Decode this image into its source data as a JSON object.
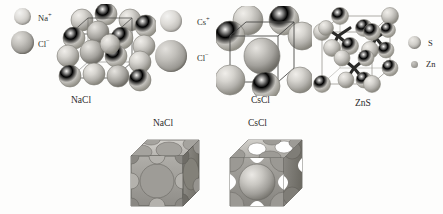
{
  "figure": {
    "background_color": "#fdfdfc",
    "ink_color": "#2b2b2b"
  },
  "legends": {
    "nacl": {
      "items": [
        {
          "label": "Na",
          "charge": "+",
          "icon": "sphere-light-icon",
          "size": "small",
          "name": "sodium-ion"
        },
        {
          "label": "Cl",
          "charge": "−",
          "icon": "sphere-dark-icon",
          "size": "large",
          "name": "chloride-ion"
        }
      ]
    },
    "cscl": {
      "items": [
        {
          "label": "Cs",
          "charge": "+",
          "icon": "sphere-light-icon",
          "size": "medium",
          "name": "cesium-ion"
        },
        {
          "label": "Cl",
          "charge": "−",
          "icon": "sphere-dark-icon",
          "size": "large",
          "name": "chloride-ion"
        }
      ]
    },
    "zns": {
      "items": [
        {
          "label": "S",
          "charge": "",
          "icon": "sphere-light-icon",
          "size": "medium",
          "name": "sulfur-atom"
        },
        {
          "label": "Zn",
          "charge": "",
          "icon": "sphere-dark-icon",
          "size": "small",
          "name": "zinc-atom"
        }
      ]
    }
  },
  "structures": [
    {
      "id": "nacl",
      "caption": "NaCl",
      "name": "nacl-structure",
      "type": "rock-salt"
    },
    {
      "id": "cscl",
      "caption": "CsCl",
      "name": "cscl-structure",
      "type": "body-centered-cubic"
    },
    {
      "id": "zns",
      "caption": "ZnS",
      "name": "zns-structure",
      "type": "zincblende"
    }
  ],
  "packed_models": [
    {
      "id": "nacl-packed",
      "caption": "NaCl",
      "name": "nacl-packed-cube"
    },
    {
      "id": "cscl-packed",
      "caption": "CsCl",
      "name": "cscl-packed-cube"
    }
  ]
}
